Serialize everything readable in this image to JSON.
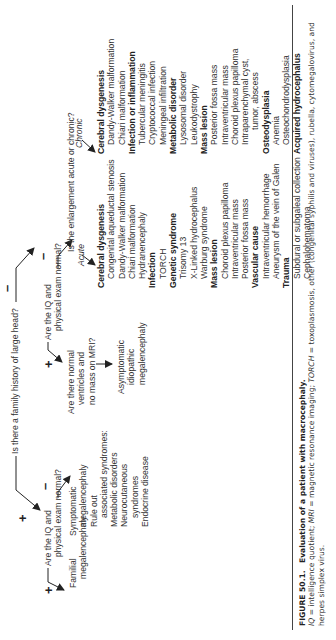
{
  "figure": {
    "root_question": "Is there a family history of large head?",
    "branch_positive": {
      "sign": "+",
      "question": [
        "Are the IQ and",
        "physical exam normal?"
      ],
      "positive": {
        "sign": "+",
        "result": [
          "Familial",
          "megalencephaly"
        ]
      },
      "negative": {
        "sign": "–",
        "result_lines": [
          {
            "text": "Symptomatic",
            "indent": 0
          },
          {
            "text": "megalencephaly",
            "indent": 1
          },
          {
            "text": "Rule out",
            "indent": 1
          },
          {
            "text": "associated syndromes:",
            "indent": 2
          },
          {
            "text": "Metabolic disorders",
            "indent": 1
          },
          {
            "text": "Neurocutaneous",
            "indent": 1
          },
          {
            "text": "syndromes",
            "indent": 2
          },
          {
            "text": "Endocrine disease",
            "indent": 1
          }
        ]
      }
    },
    "branch_negative": {
      "sign": "–",
      "question": [
        "Are the IQ and",
        "physical exam normal?"
      ],
      "positive": {
        "sign": "+",
        "question": [
          "Are there normal",
          "ventricles and",
          "no mass on MRI?"
        ],
        "result": [
          "Asymptomatic",
          "idiopathic",
          "megalencephaly"
        ]
      },
      "negative": {
        "sign": "–",
        "question": "Is the enlargement acute or chronic?",
        "acute": {
          "label": "Acute",
          "items": [
            {
              "text": "Cerebral dysgenesis",
              "bold": true
            },
            {
              "text": "Congenital aqueductal stenosis",
              "bold": false
            },
            {
              "text": "Dandy-Walker malformation",
              "bold": false
            },
            {
              "text": "Chiari malformation",
              "bold": false
            },
            {
              "text": "Hydranencephaly",
              "bold": false
            },
            {
              "text": "Infection",
              "bold": true
            },
            {
              "text": "TORCH",
              "bold": false
            },
            {
              "text": "Genetic syndrome",
              "bold": true
            },
            {
              "text": "Trisomy 13",
              "bold": false
            },
            {
              "text": "X-Linked hydrocephalus",
              "bold": false
            },
            {
              "text": "Warburg syndrome",
              "bold": false
            },
            {
              "text": "Mass lesion",
              "bold": true
            },
            {
              "text": "Choroid plexus papilloma",
              "bold": false
            },
            {
              "text": "Intraventricular mass",
              "bold": false
            },
            {
              "text": "Posterior fossa mass",
              "bold": false
            },
            {
              "text": "Vascular cause",
              "bold": true
            },
            {
              "text": "Intraventricular hemorrhage",
              "bold": false
            },
            {
              "text": "Aneurysm of the vein of Galen",
              "bold": false
            },
            {
              "text": "Trauma",
              "bold": true
            },
            {
              "text": "Subdural or subgaleal collection",
              "bold": false
            },
            {
              "text": "Cephalohematoma",
              "bold": false
            }
          ]
        },
        "chronic": {
          "label": "Chronic",
          "items": [
            {
              "text": "Cerebral dysgenesis",
              "bold": true
            },
            {
              "text": "Dandy-Walker malformation",
              "bold": false
            },
            {
              "text": "Chiari malformation",
              "bold": false
            },
            {
              "text": "Infection or inflammation",
              "bold": true
            },
            {
              "text": "Tubercular meningitis",
              "bold": false
            },
            {
              "text": "Cryptococcal infection",
              "bold": false
            },
            {
              "text": "Meningeal infiltration",
              "bold": false
            },
            {
              "text": "Metabolic disorder",
              "bold": true
            },
            {
              "text": "Lysosomal disorder",
              "bold": false
            },
            {
              "text": "Leukodystrophy",
              "bold": false
            },
            {
              "text": "Mass lesion",
              "bold": true
            },
            {
              "text": "Posterior fossa mass",
              "bold": false
            },
            {
              "text": "Intraventricular mass",
              "bold": false
            },
            {
              "text": "Choroid plexus papilloma",
              "bold": false
            },
            {
              "text": "Intraparenchymal cyst,",
              "bold": false
            },
            {
              "text": "tumor, abscess",
              "bold": false,
              "extra_indent": true
            },
            {
              "text": "Osteodysplasia",
              "bold": true
            },
            {
              "text": "Anemia",
              "bold": false
            },
            {
              "text": "Osteochondrodysplasia",
              "bold": false
            },
            {
              "text": "Acquired hydrocephalus",
              "bold": true
            }
          ]
        }
      }
    }
  },
  "caption": {
    "figure_label": "FIGURE 50.1.",
    "title": "Evaluation of a patient with macrocephaly.",
    "abbrev_1_term": "IQ",
    "abbrev_1_def": " = intelligence quotient; ",
    "abbrev_2_term": "MRI",
    "abbrev_2_def": " = magnetic resonance imaging; ",
    "abbrev_3_term": "TORCH",
    "abbrev_3_def": " = toxoplasmosis, other (congenital syphilis and viruses), rubella, cytomegalovirus, and herpes simplex virus."
  }
}
